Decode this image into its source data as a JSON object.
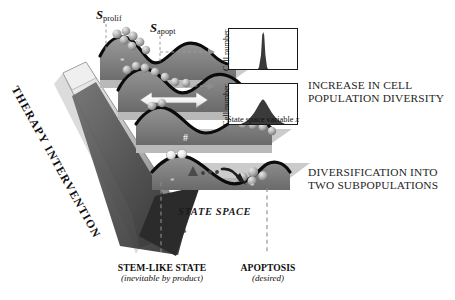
{
  "figure": {
    "title_hidden": "",
    "background": "#ffffff"
  },
  "labels": {
    "s_prolif": {
      "symbol": "S",
      "subscript": "prolif"
    },
    "s_apopt": {
      "symbol": "S",
      "subscript": "apopt"
    },
    "therapy_arrow": "THERAPY INTERVENTION",
    "state_space": "STATE SPACE",
    "increase_diversity_line1": "INCREASE IN CELL",
    "increase_diversity_line2": "POPULATION DIVERSITY",
    "diversification_line1": "DIVERSIFICATION INTO",
    "diversification_line2": "TWO SUBPOPULATIONS",
    "stem_like_title": "STEM-LIKE STATE",
    "stem_like_sub": "(inevitable by product)",
    "apoptosis_title": "APOPTOSIS",
    "apoptosis_sub": "(desired)",
    "marker_star": "*",
    "marker_hash": "#"
  },
  "histograms": {
    "y_axis_label": "Cell number",
    "x_axis_label_prefix": "State space variable ",
    "x_axis_label_var": "x",
    "top": {
      "name": "narrow-unimodal-distribution",
      "shape": "narrow sharp peak",
      "peak_x_frac": 0.48,
      "width_frac": 0.05,
      "peak_height_frac": 0.92
    },
    "bottom": {
      "name": "broad-unimodal-distribution",
      "shape": "broad spread distribution",
      "peak_x_frac": 0.47,
      "width_frac": 0.3,
      "peak_height_frac": 0.62
    }
  },
  "landscapes": [
    {
      "id": "landscape-1",
      "description": "top landscape with two hills, cells at two positions",
      "cell_clusters": 2
    },
    {
      "id": "landscape-2",
      "description": "second landscape with white double-headed arrow indicating widening",
      "cell_clusters": 2
    },
    {
      "id": "landscape-3",
      "description": "third landscape, hash marker, cells sliding to right valley",
      "cell_clusters": 2
    },
    {
      "id": "landscape-4",
      "description": "bottom landscape, split into two subpopulations with curved arrow",
      "cell_clusters": 2
    }
  ],
  "colors": {
    "landscape_fill_top": "#8e8e8e",
    "landscape_fill_bottom": "#6e6e6e",
    "landscape_edge": "#0d0d0d",
    "slab_light": "#d6d6d6",
    "slab_mid": "#9a9a9a",
    "arrow_gray": "#8a8a8a",
    "arrow_dark": "#3d3d3d",
    "cell_light": "#cfcfcf",
    "cell_mid": "#9d9d9d",
    "cell_dark": "#6a6a6a",
    "histogram_fill": "#3a3a3a",
    "text": "#1b1b1b",
    "dashed_line": "#8c8c8c"
  }
}
